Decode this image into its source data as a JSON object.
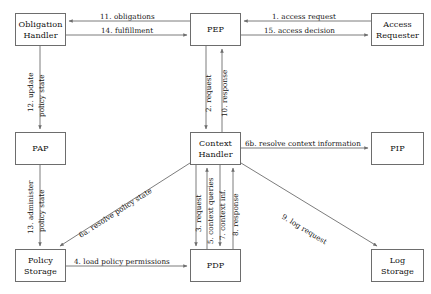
{
  "diagram": {
    "type": "flow-diagram",
    "stroke_color": "#6d6d6d",
    "text_color": "#111111",
    "background": "#ffffff",
    "nodes": [
      {
        "id": "obligation-handler",
        "label_line1": "Obligation",
        "label_line2": "Handler",
        "x": 15,
        "y": 13,
        "w": 51,
        "h": 33
      },
      {
        "id": "pep",
        "label_line1": "PEP",
        "label_line2": "",
        "x": 190,
        "y": 13,
        "w": 51,
        "h": 33
      },
      {
        "id": "access-requester",
        "label_line1": "Access",
        "label_line2": "Requester",
        "x": 371,
        "y": 13,
        "w": 53,
        "h": 33
      },
      {
        "id": "pap",
        "label_line1": "PAP",
        "label_line2": "",
        "x": 15,
        "y": 132,
        "w": 51,
        "h": 33
      },
      {
        "id": "context-handler",
        "label_line1": "Context",
        "label_line2": "Handler",
        "x": 190,
        "y": 132,
        "w": 51,
        "h": 33
      },
      {
        "id": "pip",
        "label_line1": "PIP",
        "label_line2": "",
        "x": 371,
        "y": 132,
        "w": 53,
        "h": 33
      },
      {
        "id": "policy-storage",
        "label_line1": "Policy",
        "label_line2": "Storage",
        "x": 15,
        "y": 249,
        "w": 51,
        "h": 33
      },
      {
        "id": "pdp",
        "label_line1": "PDP",
        "label_line2": "",
        "x": 190,
        "y": 249,
        "w": 51,
        "h": 33
      },
      {
        "id": "log-storage",
        "label_line1": "Log",
        "label_line2": "Storage",
        "x": 371,
        "y": 249,
        "w": 53,
        "h": 33
      }
    ],
    "edges": [
      {
        "id": "e11",
        "label": "11. obligations",
        "from": "pep",
        "to": "obligation-handler",
        "orientation": "horizontal"
      },
      {
        "id": "e14",
        "label": "14. fulfillment",
        "from": "obligation-handler",
        "to": "pep",
        "orientation": "horizontal"
      },
      {
        "id": "e1",
        "label": "1. access request",
        "from": "access-requester",
        "to": "pep",
        "orientation": "horizontal"
      },
      {
        "id": "e15",
        "label": "15. access decision",
        "from": "pep",
        "to": "access-requester",
        "orientation": "horizontal"
      },
      {
        "id": "e12",
        "label_line1": "12. update",
        "label_line2": "policy state",
        "from": "obligation-handler",
        "to": "pap",
        "orientation": "vertical"
      },
      {
        "id": "e2",
        "label": "2. request",
        "from": "pep",
        "to": "context-handler",
        "orientation": "vertical"
      },
      {
        "id": "e10",
        "label": "10. response",
        "from": "context-handler",
        "to": "pep",
        "orientation": "vertical"
      },
      {
        "id": "e6b",
        "label": "6b. resolve context information",
        "from": "context-handler",
        "to": "pip",
        "orientation": "horizontal"
      },
      {
        "id": "e13",
        "label_line1": "13. administer",
        "label_line2": "policy state",
        "from": "pap",
        "to": "policy-storage",
        "orientation": "vertical"
      },
      {
        "id": "e6a",
        "label": "6a. resolve policy state",
        "from": "context-handler",
        "to": "policy-storage",
        "orientation": "diagonal"
      },
      {
        "id": "e3",
        "label": "3. request",
        "from": "context-handler",
        "to": "pdp",
        "orientation": "vertical"
      },
      {
        "id": "e5",
        "label": "5. context queries",
        "from": "pdp",
        "to": "context-handler",
        "orientation": "vertical"
      },
      {
        "id": "e7",
        "label": "7. context inf.",
        "from": "context-handler",
        "to": "pdp",
        "orientation": "vertical"
      },
      {
        "id": "e8",
        "label": "8. response",
        "from": "pdp",
        "to": "context-handler",
        "orientation": "vertical"
      },
      {
        "id": "e9",
        "label": "9. log request",
        "from": "context-handler",
        "to": "log-storage",
        "orientation": "diagonal"
      },
      {
        "id": "e4",
        "label": "4. load policy permissions",
        "from": "policy-storage",
        "to": "pdp",
        "orientation": "horizontal"
      }
    ]
  }
}
